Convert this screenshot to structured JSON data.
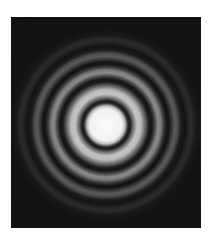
{
  "image": {
    "description": "Circular diffraction pattern (Airy rings) — bright central disk surrounded by concentric alternating bright and dark rings on a black square",
    "background_color": "#ffffff",
    "frame_color": "#111111",
    "center_color": "#fafafa",
    "ring_count_visible": 4
  }
}
